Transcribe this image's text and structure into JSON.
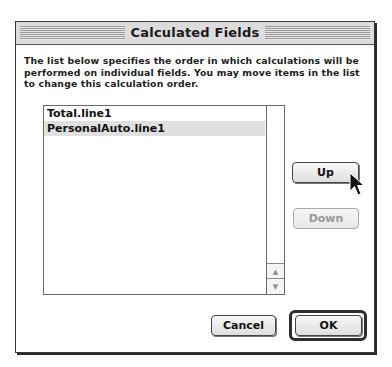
{
  "dialog": {
    "title": "Calculated Fields",
    "description": "The list below specifies the order in which calculations will be performed on individual fields. You may move items in the list to change this calculation order."
  },
  "list": {
    "items": [
      {
        "label": "Total.line1",
        "selected": false
      },
      {
        "label": "PersonalAuto.line1",
        "selected": true
      }
    ],
    "scrollbar": {
      "up_icon": "scroll-up-arrow",
      "down_icon": "scroll-down-arrow"
    }
  },
  "buttons": {
    "up": "Up",
    "down": "Down",
    "cancel": "Cancel",
    "ok": "OK"
  },
  "state": {
    "down_enabled": false,
    "default_button": "OK"
  },
  "icons": {
    "scroll_up": "▲",
    "scroll_down": "▼"
  },
  "colors": {
    "selection": "#e0e0e0",
    "disabled_text": "#999999",
    "frame": "#3a3a3a"
  }
}
